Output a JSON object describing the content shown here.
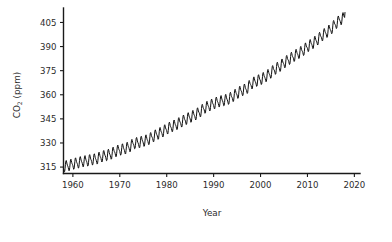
{
  "chart_data": {
    "type": "line",
    "title": "",
    "subtitle": "",
    "xlabel": "Year",
    "ylabel": "CO2 (ppm)",
    "ylabel_parts": {
      "base": "CO",
      "subscript": "2",
      "units": " (ppm)"
    },
    "xlim": [
      1958,
      2020
    ],
    "ylim": [
      311,
      414
    ],
    "grid": false,
    "legend": null,
    "legend_position": "none",
    "xticks": [
      1960,
      1970,
      1980,
      1990,
      2000,
      2010,
      2020
    ],
    "xtick_labels": [
      "1960",
      "1970",
      "1980",
      "1990",
      "2000",
      "2010",
      "2020"
    ],
    "yticks": [
      315,
      330,
      345,
      360,
      375,
      390,
      405
    ],
    "ytick_labels": [
      "315",
      "330",
      "345",
      "360",
      "375",
      "390",
      "405"
    ],
    "series": [
      {
        "name": "Atmospheric CO2 concentration",
        "color": "#111111",
        "seasonal_amplitude_ppm": 3.0,
        "seasonal_period_years": 1.0,
        "x": [
          1958,
          1959,
          1960,
          1961,
          1962,
          1963,
          1964,
          1965,
          1966,
          1967,
          1968,
          1969,
          1970,
          1971,
          1972,
          1973,
          1974,
          1975,
          1976,
          1977,
          1978,
          1979,
          1980,
          1981,
          1982,
          1983,
          1984,
          1985,
          1986,
          1987,
          1988,
          1989,
          1990,
          1991,
          1992,
          1993,
          1994,
          1995,
          1996,
          1997,
          1998,
          1999,
          2000,
          2001,
          2002,
          2003,
          2004,
          2005,
          2006,
          2007,
          2008,
          2009,
          2010,
          2011,
          2012,
          2013,
          2014,
          2015,
          2016,
          2017,
          2018
        ],
        "values": [
          315.3,
          315.9,
          316.9,
          317.6,
          318.4,
          318.9,
          319.6,
          320.0,
          321.4,
          322.2,
          323.0,
          324.6,
          325.7,
          326.3,
          327.5,
          329.7,
          330.2,
          331.1,
          332.0,
          333.8,
          335.4,
          336.8,
          338.7,
          340.1,
          341.4,
          343.0,
          344.6,
          346.0,
          347.4,
          349.2,
          351.6,
          353.1,
          354.4,
          355.6,
          356.4,
          357.1,
          358.8,
          360.8,
          362.6,
          363.7,
          366.7,
          368.4,
          369.5,
          371.1,
          373.2,
          375.8,
          377.5,
          379.8,
          381.9,
          383.8,
          385.6,
          387.4,
          389.9,
          391.7,
          393.9,
          396.5,
          398.7,
          400.8,
          404.2,
          406.6,
          408.5
        ]
      }
    ]
  },
  "axes": {
    "x_axis_label": "Year",
    "y_axis_label": "CO2 (ppm)"
  }
}
